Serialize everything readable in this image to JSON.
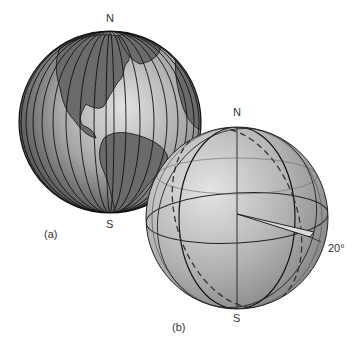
{
  "figure": {
    "globe_a": {
      "north_label": "N",
      "south_label": "S",
      "caption": "(a)"
    },
    "globe_b": {
      "north_label": "N",
      "south_label": "S",
      "caption": "(b)",
      "angle_label": "20°"
    }
  },
  "colors": {
    "sphere_light": "#d4d4d4",
    "sphere_mid": "#9e9e9e",
    "sphere_dark": "#555555",
    "land": "#6e6e6e",
    "line": "#111111"
  }
}
